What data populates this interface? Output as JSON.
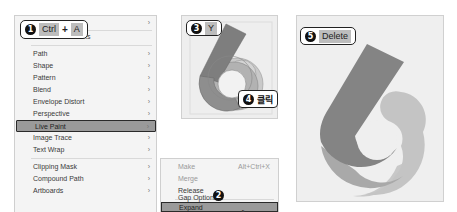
{
  "menu": {
    "items": [
      {
        "label": "",
        "has_submenu": true,
        "top": 16
      },
      {
        "label": "Create Trim Marks",
        "has_submenu": false,
        "top": 30
      },
      {
        "label": "Path",
        "has_submenu": true,
        "top": 47
      },
      {
        "label": "Shape",
        "has_submenu": true,
        "top": 59
      },
      {
        "label": "Pattern",
        "has_submenu": true,
        "top": 71
      },
      {
        "label": "Blend",
        "has_submenu": true,
        "top": 83
      },
      {
        "label": "Envelope Distort",
        "has_submenu": true,
        "top": 95
      },
      {
        "label": "Perspective",
        "has_submenu": true,
        "top": 107
      },
      {
        "label": "Live Paint",
        "has_submenu": true,
        "top": 119,
        "highlighted": true
      },
      {
        "label": "Image Trace",
        "has_submenu": true,
        "top": 131
      },
      {
        "label": "Text Wrap",
        "has_submenu": true,
        "top": 143
      },
      {
        "label": "Clipping Mask",
        "has_submenu": true,
        "top": 160
      },
      {
        "label": "Compound Path",
        "has_submenu": true,
        "top": 172
      },
      {
        "label": "Artboards",
        "has_submenu": true,
        "top": 184
      }
    ],
    "arrow": "›"
  },
  "submenu": {
    "items": [
      {
        "label": "Make",
        "shortcut": "Alt+Ctrl+X",
        "disabled": true
      },
      {
        "label": "Merge",
        "shortcut": "",
        "disabled": true
      },
      {
        "label": "Release",
        "shortcut": "",
        "disabled": false
      },
      {
        "label": "Gap Options...",
        "shortcut": "",
        "disabled": false
      },
      {
        "label": "Expand",
        "shortcut": "",
        "disabled": false,
        "highlighted": true
      }
    ]
  },
  "callouts": {
    "step1": {
      "num": "1",
      "key1": "Ctrl",
      "plus": "+",
      "key2": "A"
    },
    "step2": {
      "num": "2"
    },
    "step3": {
      "num": "3",
      "key": "Y"
    },
    "step4": {
      "num": "4",
      "label": "클릭"
    },
    "step5": {
      "num": "5",
      "key": "Delete"
    }
  },
  "colors": {
    "dark_stroke": "#7a7a7a",
    "mid_fill": "#a8a8a8",
    "light_fill": "#c6c6c6",
    "panel_bg": "#eeeeee"
  }
}
